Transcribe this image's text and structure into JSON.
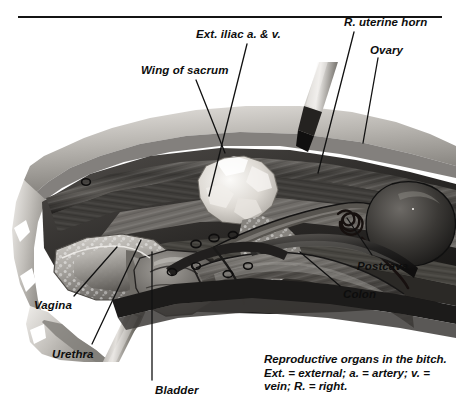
{
  "figure": {
    "title": "Reproductive organs in the bitch",
    "medium": "grayscale anatomical illustration"
  },
  "labels": [
    {
      "id": "ext-iliac",
      "text": "Ext. iliac a. & v.",
      "x": 196,
      "y": 29,
      "leader": {
        "x1": 247,
        "y1": 44,
        "x2": 209,
        "y2": 196
      }
    },
    {
      "id": "r-uterine-horn",
      "text": "R. uterine horn",
      "x": 344,
      "y": 17,
      "leader": {
        "x1": 354,
        "y1": 32,
        "x2": 318,
        "y2": 173
      }
    },
    {
      "id": "wing-of-sacrum",
      "text": "Wing of sacrum",
      "x": 141,
      "y": 65,
      "leader": {
        "x1": 196,
        "y1": 80,
        "x2": 225,
        "y2": 153
      }
    },
    {
      "id": "ovary",
      "text": "Ovary",
      "x": 370,
      "y": 45,
      "leader": {
        "x1": 378,
        "y1": 58,
        "x2": 363,
        "y2": 143
      }
    },
    {
      "id": "postcava",
      "text": "Postcava",
      "x": 357,
      "y": 261,
      "leader": {
        "x1": 372,
        "y1": 255,
        "x2": 347,
        "y2": 218
      }
    },
    {
      "id": "colon",
      "text": "Colon",
      "x": 343,
      "y": 289,
      "leader": {
        "x1": 340,
        "y1": 286,
        "x2": 300,
        "y2": 252
      }
    },
    {
      "id": "vagina",
      "text": "Vagina",
      "x": 34,
      "y": 300,
      "leader": {
        "x1": 74,
        "y1": 296,
        "x2": 117,
        "y2": 247
      }
    },
    {
      "id": "urethra",
      "text": "Urethra",
      "x": 52,
      "y": 349,
      "leader": {
        "x1": 92,
        "y1": 344,
        "x2": 141,
        "y2": 240
      }
    },
    {
      "id": "bladder",
      "text": "Bladder",
      "x": 155,
      "y": 385,
      "leader": {
        "x1": 152,
        "y1": 380,
        "x2": 152,
        "y2": 252
      }
    }
  ],
  "caption": {
    "lines": [
      "Reproductive organs in the bitch.",
      "Ext. = external; a. = artery; v. =",
      "vein; R. = right."
    ]
  },
  "instruments": [
    {
      "id": "upper-probe",
      "name": "surgical-probe-upper",
      "description": "metal probe angled from upper right into the pelvic cavity"
    },
    {
      "id": "lower-probe",
      "name": "surgical-probe-lower",
      "description": "metal probe angled from lower left toward the urethra"
    }
  ],
  "palette": {
    "ink": "#0d0d0d",
    "rule": "#141414",
    "leader": "#111111",
    "tissue_light": "#d8d5d1",
    "tissue_mid": "#9a9791",
    "tissue_dark": "#4a4845",
    "tissue_deep": "#201f1e",
    "bone_highlight": "#f2f0ec",
    "background": "#ffffff"
  }
}
